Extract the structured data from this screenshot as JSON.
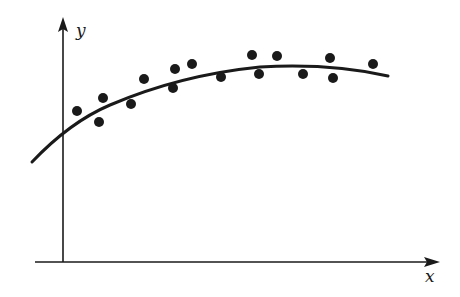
{
  "figure": {
    "x_axis_label": "x",
    "y_axis_label": "y",
    "ink_color": "#1a1a1a",
    "background": "#ffffff"
  },
  "chart_data": {
    "type": "scatter",
    "title": "",
    "xlabel": "x",
    "ylabel": "y",
    "grid": false,
    "legend": null,
    "note": "Scatter of data points with a concave-down fitted curve; no numeric ticks. Coordinates are pixel positions.",
    "points": [
      {
        "x": 77,
        "y": 111
      },
      {
        "x": 99,
        "y": 122
      },
      {
        "x": 103,
        "y": 98
      },
      {
        "x": 131,
        "y": 104
      },
      {
        "x": 144,
        "y": 79
      },
      {
        "x": 173,
        "y": 88
      },
      {
        "x": 175,
        "y": 69
      },
      {
        "x": 192,
        "y": 64
      },
      {
        "x": 221,
        "y": 77
      },
      {
        "x": 252,
        "y": 55
      },
      {
        "x": 259,
        "y": 74
      },
      {
        "x": 277,
        "y": 56
      },
      {
        "x": 303,
        "y": 74
      },
      {
        "x": 330,
        "y": 58
      },
      {
        "x": 333,
        "y": 78
      },
      {
        "x": 373,
        "y": 64
      }
    ],
    "fit_curve": "M32,162 Q70,122 110,105 Q180,75 260,67 Q330,63 388,76"
  }
}
